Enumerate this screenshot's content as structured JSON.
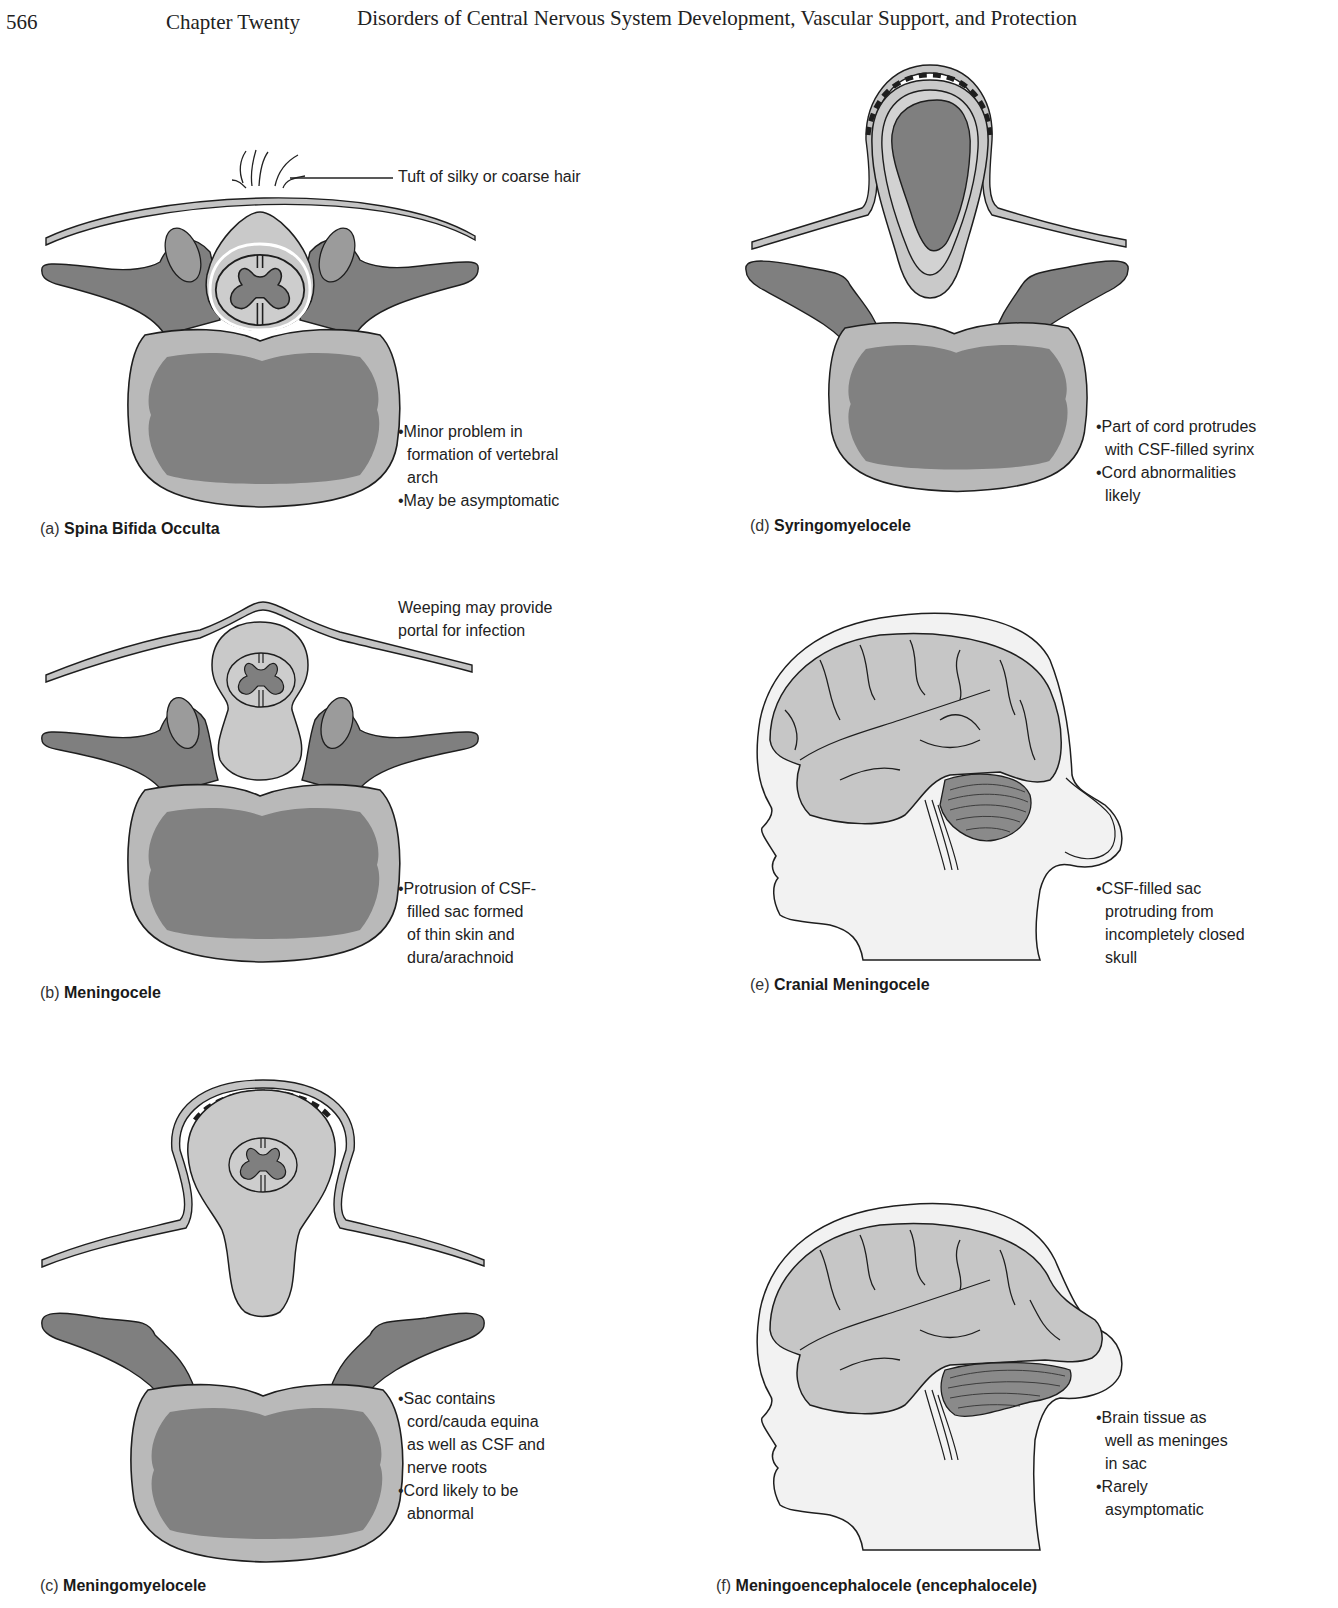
{
  "header": {
    "page_number": "566",
    "chapter": "Chapter Twenty",
    "title": "Disorders of Central Nervous System Development, Vascular Support, and Protection"
  },
  "colors": {
    "bone_dark": "#808080",
    "bone_light": "#b8b8b8",
    "cord_light": "#c8c8c8",
    "skin": "#c4c4c4",
    "head_fill": "#f2f2f2",
    "outline": "#1e1e1e"
  },
  "panels": [
    {
      "id": "a",
      "letter": "(a)",
      "name": "Spina Bifida Occulta",
      "callout": "Tuft of silky or coarse hair",
      "notes": [
        {
          "bullet": "•",
          "lines": [
            "Minor problem in",
            "formation of vertebral",
            "arch"
          ]
        },
        {
          "bullet": "•",
          "lines": [
            "May be asymptomatic"
          ]
        }
      ]
    },
    {
      "id": "b",
      "letter": "(b)",
      "name": "Meningocele",
      "callout_lines": [
        "Weeping may provide",
        "portal for infection"
      ],
      "notes": [
        {
          "bullet": "•",
          "lines": [
            "Protrusion of CSF-",
            "filled sac formed",
            "of thin skin and",
            "dura/arachnoid"
          ]
        }
      ]
    },
    {
      "id": "c",
      "letter": "(c)",
      "name": "Meningomyelocele",
      "notes": [
        {
          "bullet": "•",
          "lines": [
            "Sac contains",
            "cord/cauda equina",
            "as well as CSF and",
            "nerve roots"
          ]
        },
        {
          "bullet": "•",
          "lines": [
            "Cord likely to be",
            "abnormal"
          ]
        }
      ]
    },
    {
      "id": "d",
      "letter": "(d)",
      "name": "Syringomyelocele",
      "notes": [
        {
          "bullet": "•",
          "lines": [
            "Part of cord protrudes",
            "with CSF-filled syrinx"
          ]
        },
        {
          "bullet": "•",
          "lines": [
            "Cord abnormalities",
            "likely"
          ]
        }
      ]
    },
    {
      "id": "e",
      "letter": "(e)",
      "name": "Cranial Meningocele",
      "notes": [
        {
          "bullet": "•",
          "lines": [
            "CSF-filled sac",
            "protruding from",
            "incompletely closed",
            "skull"
          ]
        }
      ]
    },
    {
      "id": "f",
      "letter": "(f)",
      "name": "Meningoencephalocele (encephalocele)",
      "notes": [
        {
          "bullet": "•",
          "lines": [
            "Brain tissue as",
            "well as meninges",
            "in sac"
          ]
        },
        {
          "bullet": "•",
          "lines": [
            "Rarely",
            "asymptomatic"
          ]
        }
      ]
    }
  ]
}
